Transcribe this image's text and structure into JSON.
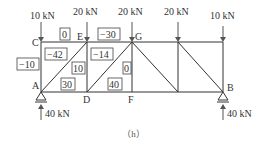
{
  "caption": "（h）",
  "loads": [
    {
      "label": "10 kN",
      "x": 41
    },
    {
      "label": "20 kN",
      "x": 87
    },
    {
      "label": "20 kN",
      "x": 132
    },
    {
      "label": "20 kN",
      "x": 178
    },
    {
      "label": "10 kN",
      "x": 223
    }
  ],
  "reactions": [
    {
      "label": "40 kN",
      "node": "A"
    },
    {
      "label": "40 kN",
      "node": "B"
    }
  ],
  "nodes": {
    "A": "A",
    "B": "B",
    "C": "C",
    "D": "D",
    "E": "E",
    "F": "F",
    "G": "G"
  },
  "member_forces": {
    "CE": "0",
    "EG": "−30",
    "AC": "−10",
    "CD_diag_AE": "−42",
    "ED_vertical": "10",
    "AD": "30",
    "DG_diag": "−14",
    "GF_vertical": "0",
    "DF": "40"
  },
  "colors": {
    "line": "#333333",
    "background": "#ffffff"
  }
}
